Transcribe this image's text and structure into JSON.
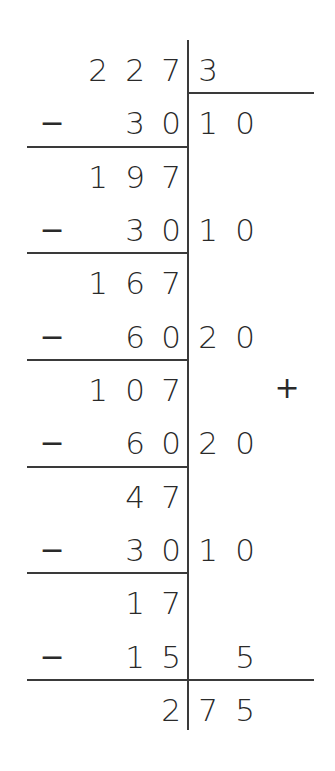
{
  "division": {
    "dividend": "2273",
    "divisor_initial": "3",
    "rows": [
      {
        "type": "number",
        "left": [
          "2",
          "2",
          "7"
        ],
        "right": [
          "3",
          ""
        ],
        "minus": false
      },
      {
        "type": "subtract",
        "left": [
          "",
          "3",
          "0"
        ],
        "right": [
          "1",
          "0"
        ],
        "minus": true
      },
      {
        "type": "number",
        "left": [
          "1",
          "9",
          "7"
        ],
        "right": [
          "",
          ""
        ],
        "minus": false
      },
      {
        "type": "subtract",
        "left": [
          "",
          "3",
          "0"
        ],
        "right": [
          "1",
          "0"
        ],
        "minus": true
      },
      {
        "type": "number",
        "left": [
          "1",
          "6",
          "7"
        ],
        "right": [
          "",
          ""
        ],
        "minus": false
      },
      {
        "type": "subtract",
        "left": [
          "",
          "6",
          "0"
        ],
        "right": [
          "2",
          "0"
        ],
        "minus": true
      },
      {
        "type": "number",
        "left": [
          "1",
          "0",
          "7"
        ],
        "right": [
          "",
          ""
        ],
        "minus": false
      },
      {
        "type": "subtract",
        "left": [
          "",
          "6",
          "0"
        ],
        "right": [
          "2",
          "0"
        ],
        "minus": true
      },
      {
        "type": "number",
        "left": [
          "",
          "4",
          "7"
        ],
        "right": [
          "",
          ""
        ],
        "minus": false
      },
      {
        "type": "subtract",
        "left": [
          "",
          "3",
          "0"
        ],
        "right": [
          "1",
          "0"
        ],
        "minus": true
      },
      {
        "type": "number",
        "left": [
          "",
          "1",
          "7"
        ],
        "right": [
          "",
          ""
        ],
        "minus": false
      },
      {
        "type": "subtract",
        "left": [
          "",
          "1",
          "5"
        ],
        "right": [
          "",
          "5"
        ],
        "minus": true
      },
      {
        "type": "result",
        "left": [
          "",
          "",
          "2"
        ],
        "right": [
          "7",
          "5"
        ],
        "minus": false
      }
    ],
    "minus_symbol": "−",
    "plus_symbol": "+",
    "result": "275"
  }
}
